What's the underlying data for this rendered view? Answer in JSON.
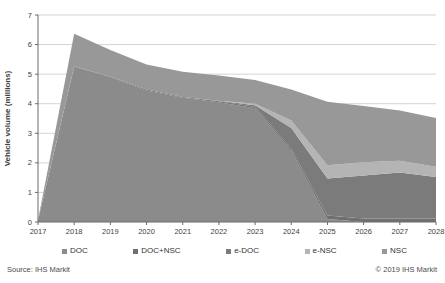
{
  "chart_data": {
    "type": "area",
    "stacked": true,
    "title": "",
    "xlabel": "",
    "ylabel": "Vehicle volume (millions)",
    "ylim": [
      0,
      7
    ],
    "grid": true,
    "legend_position": "bottom",
    "x": [
      2017,
      2018,
      2019,
      2020,
      2021,
      2022,
      2023,
      2024,
      2025,
      2026,
      2027,
      2028
    ],
    "series": [
      {
        "name": "DOC",
        "color": "#8b8b8b",
        "values": [
          0.05,
          5.25,
          4.9,
          4.45,
          4.2,
          4.05,
          3.85,
          2.4,
          0.1,
          0.0,
          0.0,
          0.0
        ]
      },
      {
        "name": "DOC+NSC",
        "color": "#707070",
        "values": [
          0.0,
          0.02,
          0.02,
          0.03,
          0.03,
          0.03,
          0.05,
          0.08,
          0.12,
          0.12,
          0.12,
          0.12
        ]
      },
      {
        "name": "e-DOC",
        "color": "#7b7b7b",
        "values": [
          0.0,
          0.0,
          0.0,
          0.0,
          0.0,
          0.02,
          0.05,
          0.7,
          1.25,
          1.45,
          1.55,
          1.4
        ]
      },
      {
        "name": "e-NSC",
        "color": "#b4b4b4",
        "values": [
          0.0,
          0.0,
          0.0,
          0.0,
          0.0,
          0.0,
          0.05,
          0.25,
          0.45,
          0.45,
          0.4,
          0.35
        ]
      },
      {
        "name": "NSC",
        "color": "#989898",
        "values": [
          0.02,
          1.1,
          0.9,
          0.85,
          0.85,
          0.85,
          0.8,
          1.05,
          2.15,
          1.9,
          1.7,
          1.65
        ]
      }
    ]
  },
  "footer": {
    "source": "Source: IHS Markit",
    "copyright": "© 2019 IHS Markit"
  },
  "colors": {
    "background": "#ffffff",
    "gridline": "#c2c2c2",
    "axis": "#6b6b6b",
    "tick_text": "#3f3f3f"
  }
}
